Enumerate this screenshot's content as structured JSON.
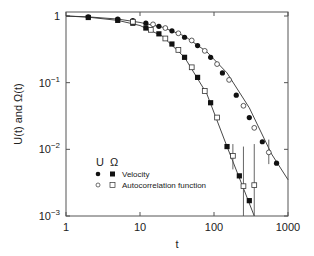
{
  "chart_data": {
    "type": "scatter",
    "title": "",
    "xlabel": "t",
    "ylabel": "U(t) and Ω(t)",
    "xscale": "log",
    "yscale": "log",
    "xlim": [
      1,
      1000
    ],
    "ylim": [
      0.001,
      1
    ],
    "x_ticks": [
      "1",
      "10",
      "100",
      "1000"
    ],
    "y_ticks": [
      "1",
      "10⁻¹",
      "10⁻²",
      "10⁻³"
    ],
    "legend": {
      "header": [
        "U",
        "Ω"
      ],
      "entries": [
        "Velocity",
        "Autocorrelation function"
      ],
      "position": "lower left"
    },
    "series": [
      {
        "name": "U Velocity",
        "marker": "filled-circle",
        "x": [
          2,
          5,
          8,
          12,
          18,
          27,
          40,
          60,
          90,
          130,
          200,
          300,
          450,
          700
        ],
        "y": [
          0.97,
          0.9,
          0.85,
          0.78,
          0.7,
          0.6,
          0.48,
          0.36,
          0.24,
          0.14,
          0.065,
          0.03,
          0.013,
          0.0062
        ]
      },
      {
        "name": "U Autocorrelation function",
        "marker": "open-circle",
        "x": [
          15,
          22,
          33,
          50,
          75,
          110,
          160,
          250,
          350,
          550
        ],
        "y": [
          0.75,
          0.66,
          0.55,
          0.43,
          0.3,
          0.19,
          0.11,
          0.045,
          0.021,
          0.009
        ],
        "err_idx": [
          9
        ],
        "err": [
          [
            0.006,
            0.014
          ]
        ]
      },
      {
        "name": "Ω Velocity",
        "marker": "filled-square",
        "x": [
          2,
          5,
          8,
          12,
          18,
          27,
          40,
          60,
          90,
          150,
          220,
          300
        ],
        "y": [
          0.95,
          0.86,
          0.78,
          0.66,
          0.54,
          0.38,
          0.24,
          0.12,
          0.05,
          0.011,
          0.004,
          0.0017
        ]
      },
      {
        "name": "Ω Autocorrelation function",
        "marker": "open-square",
        "x": [
          8,
          14,
          22,
          33,
          50,
          75,
          110,
          180,
          250,
          350
        ],
        "y": [
          0.82,
          0.62,
          0.46,
          0.31,
          0.17,
          0.075,
          0.03,
          0.008,
          0.0028,
          0.0029
        ],
        "err_idx": [
          7,
          8,
          9
        ],
        "err": [
          [
            0.005,
            0.012
          ],
          [
            0.001,
            0.011
          ],
          [
            0.001,
            0.012
          ]
        ]
      }
    ],
    "fit_lines": [
      {
        "name": "U fit",
        "x": [
          1,
          2,
          5,
          10,
          20,
          40,
          80,
          150,
          300,
          600,
          1000
        ],
        "y": [
          1.0,
          0.97,
          0.9,
          0.8,
          0.68,
          0.5,
          0.29,
          0.14,
          0.042,
          0.0085,
          0.0035
        ]
      },
      {
        "name": "Ω fit",
        "x": [
          1,
          2,
          5,
          10,
          20,
          40,
          80,
          150,
          250,
          350
        ],
        "y": [
          1.0,
          0.96,
          0.86,
          0.72,
          0.5,
          0.24,
          0.068,
          0.011,
          0.0026,
          0.001
        ]
      }
    ]
  }
}
